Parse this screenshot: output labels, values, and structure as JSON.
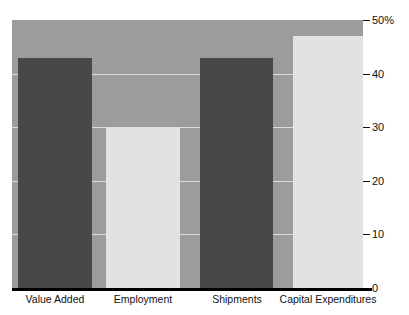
{
  "title": "",
  "chart_data": {
    "type": "bar",
    "title": "",
    "subtitle": "",
    "xlabel": "",
    "ylabel": "",
    "categories": [
      "Value Added",
      "Employment",
      "Shipments",
      "Capital Expenditures"
    ],
    "values": [
      43,
      30,
      43,
      47
    ],
    "value_unit": "%",
    "ylim": [
      0,
      50
    ],
    "yticks": [
      0,
      10,
      20,
      30,
      40,
      50
    ],
    "ytick_labels": [
      "0",
      "10",
      "20",
      "30",
      "40",
      "50%"
    ],
    "grid": true,
    "grid_axis": "y",
    "legend": "none",
    "series": [
      {
        "name": "Share",
        "values": [
          43,
          30,
          43,
          47
        ]
      }
    ],
    "bar_colors": [
      "#484848",
      "#e2e2e2",
      "#484848",
      "#e2e2e2"
    ],
    "colors": {
      "plot_background": "#9c9c9c",
      "page_background": "#ffffff",
      "gridline": "#dcdcdc",
      "axis_line": "#000000",
      "bar_dark": "#484848",
      "bar_light": "#e2e2e2",
      "text": "#111111"
    }
  }
}
